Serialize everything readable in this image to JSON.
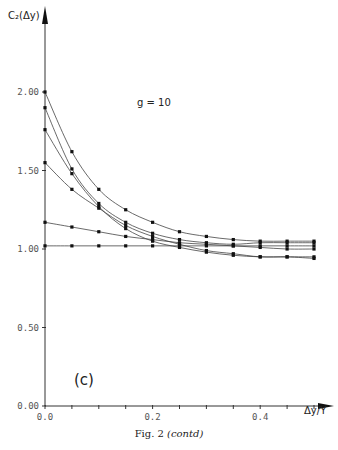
{
  "chart_data": {
    "type": "line",
    "title": "",
    "xlabel": "Δy/Y",
    "ylabel": "C₂(Δy)",
    "xlim": [
      0.0,
      0.5
    ],
    "ylim": [
      0.0,
      2.0
    ],
    "x_ticks": [
      "0.0",
      "0.2",
      "0.4"
    ],
    "y_ticks": [
      "0.00",
      "0.50",
      "1.00",
      "1.50",
      "2.00"
    ],
    "grid": false,
    "legend": null,
    "annotations": [
      "g = 10",
      "(c)"
    ],
    "x": [
      0.0,
      0.05,
      0.1,
      0.15,
      0.2,
      0.25,
      0.3,
      0.35,
      0.4,
      0.45,
      0.5
    ],
    "series": [
      {
        "name": "curve 1",
        "values": [
          2.0,
          1.62,
          1.38,
          1.25,
          1.17,
          1.11,
          1.08,
          1.06,
          1.05,
          1.05,
          1.05
        ]
      },
      {
        "name": "curve 2",
        "values": [
          1.9,
          1.51,
          1.29,
          1.17,
          1.1,
          1.06,
          1.04,
          1.03,
          1.04,
          1.04,
          1.04
        ]
      },
      {
        "name": "curve 3",
        "values": [
          1.76,
          1.48,
          1.27,
          1.13,
          1.05,
          1.01,
          0.98,
          0.96,
          0.95,
          0.95,
          0.95
        ]
      },
      {
        "name": "curve 4",
        "values": [
          1.55,
          1.38,
          1.26,
          1.15,
          1.08,
          1.03,
          0.99,
          0.97,
          0.95,
          0.95,
          0.94
        ]
      },
      {
        "name": "curve 5",
        "values": [
          1.17,
          1.14,
          1.11,
          1.08,
          1.06,
          1.04,
          1.03,
          1.02,
          1.01,
          1.0,
          1.0
        ]
      },
      {
        "name": "curve 6",
        "values": [
          1.02,
          1.02,
          1.02,
          1.02,
          1.02,
          1.02,
          1.02,
          1.02,
          1.02,
          1.02,
          1.02
        ]
      }
    ]
  },
  "labels": {
    "ylabel": "C₂(Δy)",
    "xlabel": "Δy/Y",
    "annotation": "g = 10",
    "panel": "(c)",
    "caption_main": "Fig. 2 ",
    "caption_italic": "(contd)"
  }
}
